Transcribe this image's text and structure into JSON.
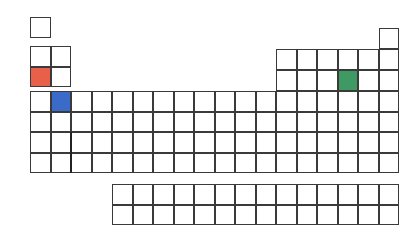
{
  "colors": {
    "line": "#3a3a3a",
    "red": "#e8604a",
    "blue": "#3a6bc8",
    "green": "#3e9a62",
    "blank": "#ffffff"
  },
  "layout": {
    "cell": 20.5,
    "left_x": 30,
    "right_x": 276,
    "periods_left_y": [
      17,
      46,
      66.5,
      91,
      111.5,
      132,
      152.5
    ],
    "periods_right_y": [
      28,
      49,
      70,
      91,
      111.5,
      132,
      152.5
    ],
    "f_block": {
      "x": 112,
      "y": [
        184,
        204.5
      ],
      "columns": 14
    }
  },
  "highlighted": [
    {
      "name": "red-element",
      "group": 1,
      "period": 3,
      "color": "red"
    },
    {
      "name": "blue-element",
      "group": 2,
      "period": 4,
      "color": "blue"
    },
    {
      "name": "green-element",
      "group": 16,
      "period": 3,
      "color": "green"
    }
  ]
}
